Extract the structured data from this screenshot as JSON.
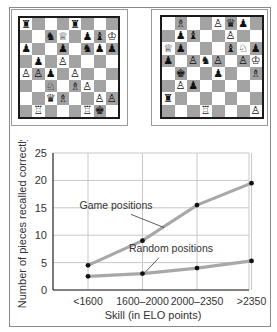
{
  "boards": [
    {
      "name": "game-position-board",
      "rows": [
        [
          "♜",
          "",
          "",
          "",
          "♜",
          "",
          "",
          ""
        ],
        [
          "",
          "",
          "♞",
          "♕",
          "",
          "♟",
          "♝",
          "♔"
        ],
        [
          "♟",
          "",
          "",
          "♟",
          "",
          "♞",
          "♟",
          "♟"
        ],
        [
          "",
          "♟",
          "",
          "♙",
          "",
          "",
          "",
          ""
        ],
        [
          "♙",
          "♙",
          "♟",
          "",
          "♙",
          "",
          "",
          ""
        ],
        [
          "",
          "",
          "♘",
          "",
          "♗",
          "♙",
          "",
          ""
        ],
        [
          "",
          "",
          "♛",
          "♗",
          "",
          "",
          "♙",
          "♙"
        ],
        [
          "",
          "♖",
          "",
          "",
          "",
          "♖",
          "♚",
          ""
        ]
      ]
    },
    {
      "name": "random-position-board",
      "rows": [
        [
          "",
          "♗",
          "",
          "",
          "♙",
          "♛",
          "♟",
          ""
        ],
        [
          "",
          "♟",
          "♝",
          "",
          "",
          "♙",
          "",
          ""
        ],
        [
          "♕",
          "♟",
          "",
          "",
          "",
          "♝",
          "♘",
          "♟"
        ],
        [
          "♟",
          "",
          "♙",
          "♞",
          "♙",
          "",
          "♙",
          "♔"
        ],
        [
          "",
          "♚",
          "",
          "",
          "♟",
          "",
          "",
          "♗"
        ],
        [
          "",
          "♙",
          "♟",
          "",
          "",
          "",
          "",
          ""
        ],
        [
          "♜",
          "",
          "",
          "",
          "",
          "",
          "",
          ""
        ],
        [
          "",
          "",
          "",
          "♖",
          "",
          "",
          "",
          "♙"
        ]
      ]
    }
  ],
  "chart_data": {
    "type": "line",
    "title": "",
    "xlabel": "Skill (in ELO points)",
    "ylabel": "Number of pieces recalled correctly",
    "categories": [
      "<1600",
      "1600–2000",
      "2000–2350",
      ">2350"
    ],
    "yticks": [
      "0",
      "5",
      "10",
      "15",
      "20",
      "25"
    ],
    "ylim": [
      0,
      25
    ],
    "grid": true,
    "series": [
      {
        "name": "Game positions",
        "values": [
          4.5,
          9,
          15.5,
          19.5
        ]
      },
      {
        "name": "Random positions",
        "values": [
          2.5,
          3,
          4,
          5.3
        ]
      }
    ],
    "annotations": [
      "Game positions",
      "Random positions"
    ],
    "colors": {
      "line": "#a8a8a8",
      "marker": "#111111",
      "grid": "#c8c8c8",
      "axis": "#222222"
    }
  }
}
